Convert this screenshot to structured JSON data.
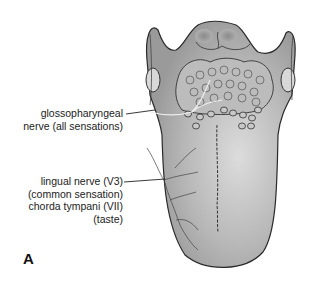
{
  "figure": {
    "panel_label": "A",
    "labels": {
      "glossopharyngeal": {
        "line1": "glossopharyngeal",
        "line2": "nerve (all sensations)"
      },
      "lingual": {
        "line1": "lingual nerve (V3)",
        "line2": "(common sensation)",
        "line3": "chorda tympani (VII)",
        "line4": "(taste)"
      }
    },
    "colors": {
      "tongue_fill": "#a8a8a8",
      "tongue_light": "#d4d4d4",
      "outline": "#2a2a2a",
      "text": "#222222"
    }
  }
}
